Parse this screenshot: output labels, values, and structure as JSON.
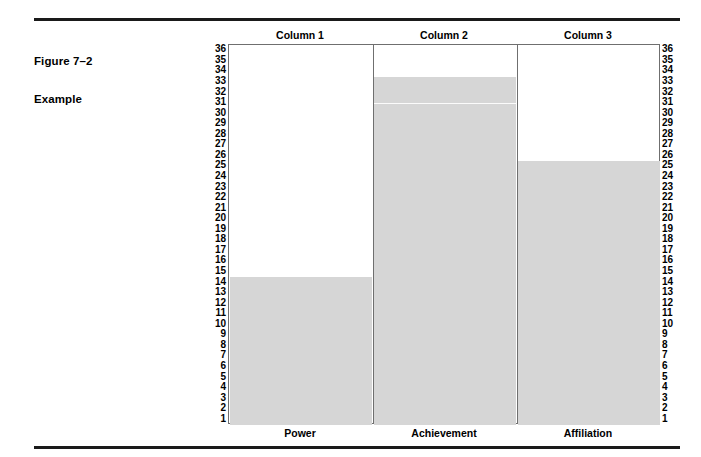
{
  "figure": {
    "label": "Figure 7–2",
    "subtitle": "Example"
  },
  "chart_data": {
    "type": "bar",
    "title": "Figure 7–2 Example",
    "subtitle": "Example",
    "xlabel": "",
    "ylabel": "",
    "ylim": [
      1,
      36
    ],
    "grid": false,
    "legend": "none",
    "categories": [
      "Power",
      "Achievement",
      "Affiliation"
    ],
    "column_headers": [
      "Column 1",
      "Column 2",
      "Column 3"
    ],
    "values": [
      14,
      33,
      25
    ],
    "tick_labels": [
      "36",
      "35",
      "34",
      "33",
      "32",
      "31",
      "30",
      "29",
      "28",
      "27",
      "26",
      "25",
      "24",
      "23",
      "22",
      "21",
      "20",
      "19",
      "18",
      "17",
      "16",
      "15",
      "14",
      "13",
      "12",
      "11",
      "10",
      "9",
      "8",
      "7",
      "6",
      "5",
      "4",
      "3",
      "2",
      "1"
    ],
    "left_axis_labels": [
      "36",
      "35",
      "34",
      "33",
      "32",
      "31",
      "30",
      "29",
      "28",
      "27",
      "26",
      "25",
      "24",
      "23",
      "22",
      "21",
      "20",
      "19",
      "18",
      "17",
      "16",
      "15",
      "14",
      "13",
      "12",
      "11",
      "10",
      "9",
      "8",
      "7",
      "6",
      "5",
      "4",
      "3",
      "2",
      "1"
    ],
    "right_axis_labels": [
      "36",
      "35",
      "34",
      "33",
      "32",
      "31",
      "30",
      "29",
      "28",
      "27",
      "26",
      "25",
      "24",
      "23",
      "22",
      "21",
      "20",
      "19",
      "18",
      "17",
      "16",
      "15",
      "14",
      "13",
      "12",
      "11",
      "10",
      "9",
      "8",
      "7",
      "6",
      "5",
      "4",
      "3",
      "2",
      "1"
    ],
    "bar_color": "#d6d6d6",
    "frame_color": "#6f6f6f",
    "rule_color": "#1a1a1a",
    "bar_artifact_gap": {
      "series_index": 1,
      "value": 30.5
    }
  }
}
